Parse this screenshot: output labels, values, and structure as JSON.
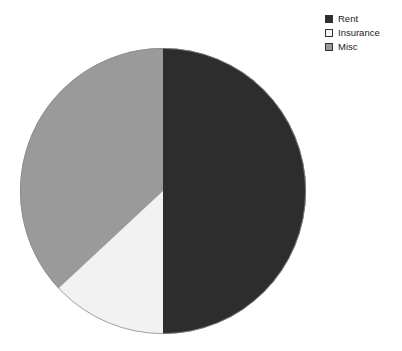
{
  "canvas": {
    "width": 402,
    "height": 351,
    "background": "#ffffff"
  },
  "legend": {
    "position": "top-right",
    "entries": [
      {
        "label": "Rent",
        "color": "#2d2d2d",
        "swatch_icon": "legend-swatch-icon"
      },
      {
        "label": "Insurance",
        "color": "#f2f2f2",
        "swatch_icon": "legend-swatch-icon"
      },
      {
        "label": "Misc",
        "color": "#9a9a9a",
        "swatch_icon": "legend-swatch-icon"
      }
    ]
  },
  "chart_data": {
    "type": "pie",
    "title": "",
    "subtitle": "",
    "xlabel": "",
    "ylabel": "",
    "legend_position": "top-right",
    "grid": false,
    "start_angle_deg": 0,
    "direction": "clockwise",
    "center": {
      "x": 163,
      "y": 191
    },
    "radius": 143,
    "categories": [
      "Rent",
      "Insurance",
      "Misc"
    ],
    "values": [
      50,
      13,
      37
    ],
    "percentages": [
      "50%",
      "13%",
      "37%"
    ],
    "colors": [
      "#2d2d2d",
      "#f2f2f2",
      "#9a9a9a"
    ],
    "slices": [
      {
        "label": "Rent",
        "value": 50,
        "percent": "50%",
        "color": "#2d2d2d",
        "start_deg": 0,
        "end_deg": 180
      },
      {
        "label": "Insurance",
        "value": 13,
        "percent": "13%",
        "color": "#f2f2f2",
        "start_deg": 180,
        "end_deg": 227
      },
      {
        "label": "Misc",
        "value": 37,
        "percent": "37%",
        "color": "#9a9a9a",
        "start_deg": 227,
        "end_deg": 360
      }
    ],
    "outline_color": "#8c8c8c"
  }
}
